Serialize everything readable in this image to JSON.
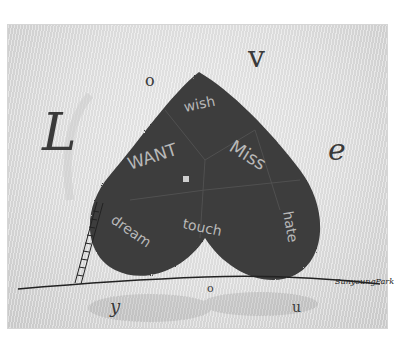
{
  "artwork": {
    "title_letters": [
      "L",
      "o",
      "v",
      "e"
    ],
    "bottom_letters": [
      "y",
      "o",
      "u"
    ],
    "heart_words": [
      "wish",
      "WANT",
      "Miss",
      "dream",
      "touch",
      "hate"
    ],
    "signature": "SunyoungPark",
    "colors": {
      "background": "#e6e6e6",
      "heart": "#3c3c3c",
      "ink": "#2e2e2e",
      "word_chalk": "#bdbdbd"
    }
  }
}
